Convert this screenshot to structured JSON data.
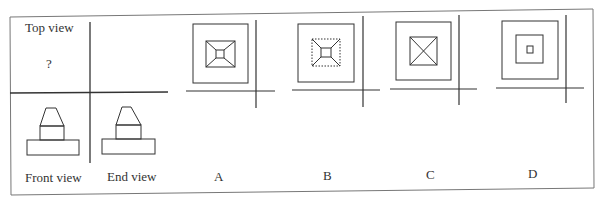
{
  "question": {
    "top_view_label": "Top view",
    "top_view_unknown": "?",
    "front_view_label": "Front view",
    "end_view_label": "End view"
  },
  "options": [
    {
      "label": "A",
      "description": "Outer square with inner square; diagonals from inner square corners to a tiny central square (frustum seen from top)"
    },
    {
      "label": "B",
      "description": "Outer square with dashed inner square; diagonals from dashed corners to a tiny central square"
    },
    {
      "label": "C",
      "description": "Outer square with inner square crossed by full diagonals (X)"
    },
    {
      "label": "D",
      "description": "Three concentric squares: outer, middle and a tiny center square"
    }
  ],
  "colors": {
    "line": "#333333",
    "border": "#666666",
    "background": "#ffffff"
  }
}
